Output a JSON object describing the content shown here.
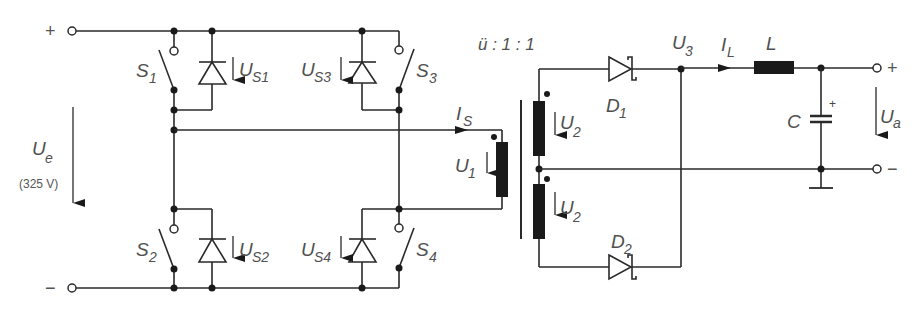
{
  "diagram": {
    "type": "push-pull forward converter (full-bridge with center-tapped transformer)",
    "input": {
      "plus_sign": "+",
      "minus_sign": "−",
      "voltage_label": "U",
      "voltage_sub": "e",
      "voltage_value": "(325 V)"
    },
    "switches": [
      {
        "label": "S",
        "sub": "1",
        "diode_voltage": "U",
        "diode_sub": "S1"
      },
      {
        "label": "S",
        "sub": "2",
        "diode_voltage": "U",
        "diode_sub": "S2"
      },
      {
        "label": "S",
        "sub": "3",
        "diode_voltage": "U",
        "diode_sub": "S3"
      },
      {
        "label": "S",
        "sub": "4",
        "diode_voltage": "U",
        "diode_sub": "S4"
      }
    ],
    "transformer": {
      "ratio": "ü : 1  : 1",
      "primary_current": "I",
      "primary_current_sub": "S",
      "primary_voltage": "U",
      "primary_voltage_sub": "1",
      "secondary_voltage": "U",
      "secondary_voltage_sub": "2"
    },
    "rectifier": {
      "d1": "D",
      "d1_sub": "1",
      "d2": "D",
      "d2_sub": "2",
      "node_voltage": "U",
      "node_voltage_sub": "3"
    },
    "filter": {
      "inductor_current": "I",
      "inductor_current_sub": "L",
      "inductor": "L",
      "capacitor": "C",
      "capacitor_polarity": "+"
    },
    "output": {
      "plus_sign": "+",
      "minus_sign": "−",
      "voltage_label": "U",
      "voltage_sub": "a"
    }
  }
}
